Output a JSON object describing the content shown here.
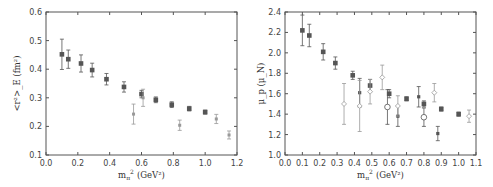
{
  "chart_data": [
    {
      "type": "scatter",
      "title": "",
      "xlabel": "m_π² (GeV²)",
      "ylabel": "<r²>_E (fm²)",
      "xlim": [
        0.0,
        1.2
      ],
      "ylim": [
        0.1,
        0.6
      ],
      "xticks": [
        "0.0",
        "0.2",
        "0.4",
        "0.6",
        "0.8",
        "1.0",
        "1.2"
      ],
      "yticks": [
        "0.1",
        "0.2",
        "0.3",
        "0.4",
        "0.5",
        "0.6"
      ],
      "grid": false,
      "series": [
        {
          "name": "filled squares",
          "marker": "filled-square",
          "points": [
            {
              "x": 0.1,
              "y": 0.452,
              "err": 0.053
            },
            {
              "x": 0.14,
              "y": 0.435,
              "err": 0.032
            },
            {
              "x": 0.22,
              "y": 0.42,
              "err": 0.03
            },
            {
              "x": 0.29,
              "y": 0.397,
              "err": 0.024
            },
            {
              "x": 0.38,
              "y": 0.365,
              "err": 0.02
            },
            {
              "x": 0.49,
              "y": 0.338,
              "err": 0.018
            },
            {
              "x": 0.6,
              "y": 0.313,
              "err": 0.013
            },
            {
              "x": 0.69,
              "y": 0.293,
              "err": 0.01
            },
            {
              "x": 0.79,
              "y": 0.276,
              "err": 0.01
            },
            {
              "x": 0.9,
              "y": 0.262,
              "err": 0.008
            },
            {
              "x": 1.0,
              "y": 0.25,
              "err": 0.007
            }
          ]
        },
        {
          "name": "small symbols",
          "marker": "small-cross",
          "points": [
            {
              "x": 0.55,
              "y": 0.243,
              "err": 0.035
            },
            {
              "x": 0.61,
              "y": 0.3,
              "err": 0.03
            },
            {
              "x": 0.84,
              "y": 0.204,
              "err": 0.018
            },
            {
              "x": 1.07,
              "y": 0.226,
              "err": 0.016
            },
            {
              "x": 1.15,
              "y": 0.17,
              "err": 0.014
            }
          ]
        }
      ]
    },
    {
      "type": "scatter",
      "title": "",
      "xlabel": "m_π² (GeV²)",
      "ylabel": "μ_p (μ_N)",
      "xlim": [
        0.0,
        1.1
      ],
      "ylim": [
        1.0,
        2.4
      ],
      "xticks": [
        "0.0",
        "0.1",
        "0.2",
        "0.3",
        "0.4",
        "0.5",
        "0.6",
        "0.7",
        "0.8",
        "0.9",
        "1.0",
        "1.1"
      ],
      "yticks": [
        "1.0",
        "1.2",
        "1.4",
        "1.6",
        "1.8",
        "2.0",
        "2.2",
        "2.4"
      ],
      "grid": false,
      "series": [
        {
          "name": "filled squares",
          "marker": "filled-square",
          "points": [
            {
              "x": 0.1,
              "y": 2.22,
              "err": 0.15
            },
            {
              "x": 0.14,
              "y": 2.17,
              "err": 0.11
            },
            {
              "x": 0.22,
              "y": 2.01,
              "err": 0.08
            },
            {
              "x": 0.29,
              "y": 1.9,
              "err": 0.06
            },
            {
              "x": 0.39,
              "y": 1.78,
              "err": 0.04
            },
            {
              "x": 0.49,
              "y": 1.68,
              "err": 0.06
            },
            {
              "x": 0.6,
              "y": 1.6,
              "err": 0.04
            },
            {
              "x": 0.7,
              "y": 1.55,
              "err": 0.02
            },
            {
              "x": 0.8,
              "y": 1.5,
              "err": 0.03
            },
            {
              "x": 0.9,
              "y": 1.45,
              "err": 0.02
            },
            {
              "x": 1.0,
              "y": 1.4,
              "err": 0.02
            }
          ]
        },
        {
          "name": "crosses",
          "marker": "cross",
          "points": [
            {
              "x": 0.43,
              "y": 1.61,
              "err": 0.14
            },
            {
              "x": 0.65,
              "y": 1.38,
              "err": 0.1
            },
            {
              "x": 0.77,
              "y": 1.57,
              "err": 0.1
            },
            {
              "x": 0.88,
              "y": 1.21,
              "err": 0.07
            }
          ]
        },
        {
          "name": "open diamonds",
          "marker": "open-diamond",
          "points": [
            {
              "x": 0.34,
              "y": 1.5,
              "err": 0.2
            },
            {
              "x": 0.43,
              "y": 1.48,
              "err": 0.25
            },
            {
              "x": 0.49,
              "y": 1.62,
              "err": 0.12
            },
            {
              "x": 0.56,
              "y": 1.76,
              "err": 0.12
            },
            {
              "x": 0.65,
              "y": 1.48,
              "err": 0.1
            },
            {
              "x": 0.86,
              "y": 1.61,
              "err": 0.09
            },
            {
              "x": 1.06,
              "y": 1.38,
              "err": 0.06
            }
          ]
        },
        {
          "name": "open circles",
          "marker": "open-circle",
          "points": [
            {
              "x": 0.59,
              "y": 1.47,
              "err": 0.17
            },
            {
              "x": 0.8,
              "y": 1.37,
              "err": 0.09
            }
          ]
        }
      ]
    }
  ],
  "panels": {
    "left": {
      "ylabel": "<r²>_E (fm²)",
      "xlabel_main": "m",
      "xlabel_sub": "π",
      "xlabel_sup": "2",
      "xlabel_unit": "(GeV²)"
    },
    "right": {
      "ylabel": "μ_p (μ_N)",
      "xlabel_main": "m",
      "xlabel_sub": "π",
      "xlabel_sup": "2",
      "xlabel_unit": "(GeV²)"
    }
  },
  "colors": {
    "frame": "#555555",
    "marker": "#555555",
    "marker_light": "#999999",
    "text": "#444444"
  }
}
